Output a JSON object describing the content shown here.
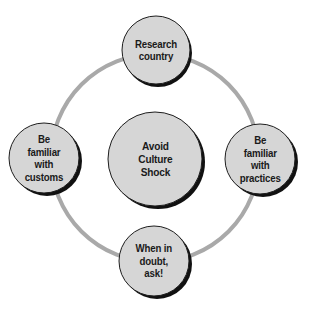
{
  "diagram": {
    "type": "cycle",
    "colors": {
      "ring": "#a9a9a9",
      "node_fill": "#d6d6d6",
      "node_outline": "#1e1e1e",
      "node_shadow": "#111111",
      "text": "#1a1a1a",
      "background": "#ffffff"
    },
    "center": {
      "label": "Avoid\nCulture\nShock"
    },
    "nodes": [
      {
        "id": "top",
        "label": "Research\ncountry"
      },
      {
        "id": "right",
        "label": "Be\nfamiliar\nwith\npractices"
      },
      {
        "id": "bottom",
        "label": "When in\ndoubt,\nask!"
      },
      {
        "id": "left",
        "label": "Be\nfamiliar\nwith\ncustoms"
      }
    ]
  }
}
